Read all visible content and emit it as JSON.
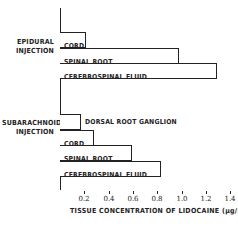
{
  "chart_data": {
    "type": "bar",
    "orientation": "horizontal",
    "title": "",
    "xlabel": "TISSUE CONCENTRATION OF LIDOCAINE (µg/mg)",
    "ylabel": "",
    "xlim": [
      0,
      1.4
    ],
    "x_ticks": [
      "0.2",
      "0.4",
      "0.6",
      "0.8",
      "1.0",
      "1.2",
      "1.4"
    ],
    "grid": false,
    "legend": null,
    "groups": [
      {
        "name": "EPIDURAL INJECTION",
        "bars": [
          {
            "label": "CORD",
            "value": 0.21
          },
          {
            "label": "SPINAL ROOT",
            "value": 0.98
          },
          {
            "label": "CEREBROSPINAL FLUID",
            "value": 1.29
          }
        ]
      },
      {
        "name": "SUBARACHNOID INJECTION",
        "bars": [
          {
            "label": "DORSAL ROOT GANGLION",
            "value": 0.17
          },
          {
            "label": "CORD",
            "value": 0.28
          },
          {
            "label": "SPINAL ROOT",
            "value": 0.59
          },
          {
            "label": "CEREBROSPINAL FLUID",
            "value": 0.83
          }
        ]
      }
    ]
  },
  "labels": {
    "epidural_line1": "EPIDURAL",
    "epidural_line2": "INJECTION",
    "subarachnoid_line1": "SUBARACHNOID",
    "subarachnoid_line2": "INJECTION"
  }
}
